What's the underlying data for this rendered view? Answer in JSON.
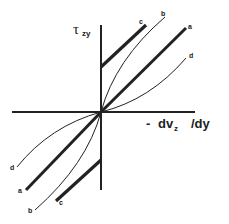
{
  "figure": {
    "type": "rheology-flow-curves",
    "y_axis": {
      "symbol": "τ",
      "subscript": "zy"
    },
    "x_axis": {
      "label_prefix": "-",
      "label_main": "dv",
      "label_sub": "z",
      "label_suffix": "/dy"
    },
    "curves": [
      {
        "id": "a",
        "label": "a",
        "style": "thick straight line through origin"
      },
      {
        "id": "b",
        "label": "b",
        "style": "thin curve, concave down"
      },
      {
        "id": "c",
        "label": "c",
        "style": "thick straight line with yield offset"
      },
      {
        "id": "d",
        "label": "d",
        "style": "thin curve, concave up"
      }
    ],
    "colors": {
      "stroke": "#222222",
      "background": "#ffffff"
    }
  }
}
